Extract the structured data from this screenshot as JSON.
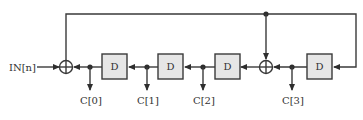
{
  "diagram": {
    "input_label": "IN[n]",
    "delay_label": "D",
    "delays": [
      {
        "label": "D"
      },
      {
        "label": "D"
      },
      {
        "label": "D"
      },
      {
        "label": "D"
      }
    ],
    "outputs": [
      {
        "label": "C[0]"
      },
      {
        "label": "C[1]"
      },
      {
        "label": "C[2]"
      },
      {
        "label": "C[3]"
      }
    ],
    "adders": 2,
    "colors": {
      "line": "#3a3a3a",
      "box_fill": "#e6e6e6"
    }
  }
}
